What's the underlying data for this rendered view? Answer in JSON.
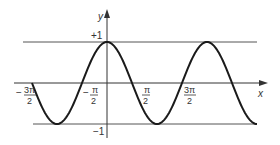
{
  "figure": {
    "axis_x_label": "x",
    "axis_y_label": "y",
    "y_max_label": "+1",
    "y_min_label": "−1",
    "tick_labels": {
      "neg_3pi_2": {
        "sign": "−",
        "num": "3π",
        "den": "2"
      },
      "neg_pi_2": {
        "sign": "−",
        "num": "π",
        "den": "2"
      },
      "pi_2": {
        "num": "π",
        "den": "2"
      },
      "three_pi_2": {
        "num": "3π",
        "den": "2"
      }
    },
    "colors": {
      "curve": "#1a1a1a",
      "axes": "#333333",
      "guide": "#555555"
    }
  },
  "chart_data": {
    "type": "line",
    "xlabel": "x",
    "ylabel": "y",
    "x_ticks": [
      "-3π/2",
      "-π/2",
      "π/2",
      "3π/2"
    ],
    "y_ticks": [
      "+1",
      "-1"
    ],
    "ylim": [
      -1,
      1
    ],
    "xlim_radians": [
      -2.0,
      7.0
    ],
    "series": [
      {
        "name": "cos x",
        "function": "cos(x)"
      }
    ],
    "guides": [
      "y = +1",
      "y = -1"
    ]
  }
}
